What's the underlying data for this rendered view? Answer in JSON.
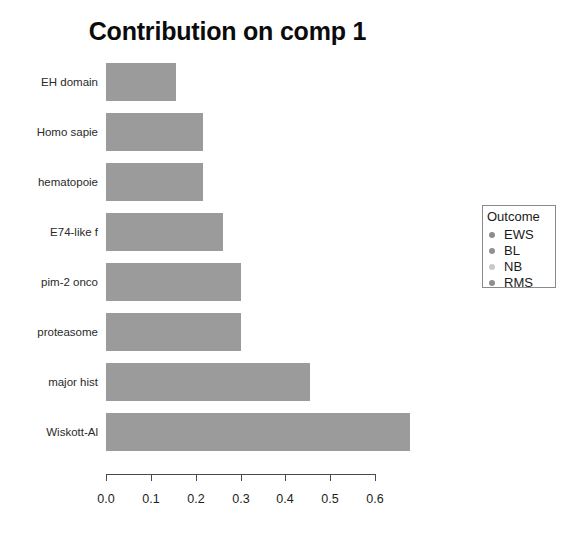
{
  "chart_data": {
    "type": "bar",
    "orientation": "horizontal",
    "title": "Contribution on comp 1",
    "xlabel": "",
    "ylabel": "",
    "categories": [
      "EH domain",
      "Homo sapie",
      "hematopoie",
      "E74-like f",
      "pim-2 onco",
      "proteasome",
      "major hist",
      "Wiskott-Al"
    ],
    "values": [
      0.156,
      0.217,
      0.217,
      0.261,
      0.301,
      0.301,
      0.455,
      0.679
    ],
    "xlim": [
      0.0,
      0.6
    ],
    "xticks": [
      0.0,
      0.1,
      0.2,
      0.3,
      0.4,
      0.5,
      0.6
    ],
    "xtick_labels": [
      "0.0",
      "0.1",
      "0.2",
      "0.3",
      "0.4",
      "0.5",
      "0.6"
    ],
    "grid": false,
    "bar_color": "#9b9b9b",
    "legend": {
      "position": "right",
      "title": "Outcome",
      "entries": [
        {
          "label": "EWS",
          "color": "#8c8c8c"
        },
        {
          "label": "BL",
          "color": "#919191"
        },
        {
          "label": "NB",
          "color": "#c9c9c9"
        },
        {
          "label": "RMS",
          "color": "#8f8f8f"
        }
      ]
    }
  },
  "colors": {
    "background": "#ffffff",
    "axis": "#4a4a4a",
    "text": "#1a1a1a",
    "bar": "#9b9b9b",
    "legend_border": "#8a8a8a"
  }
}
